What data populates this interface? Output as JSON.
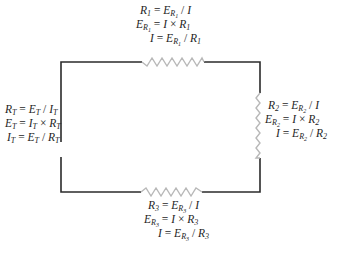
{
  "diagram": {
    "colors": {
      "wire": "#2b2b2b",
      "resistor": "#b8b8b8",
      "text": "#1e1e1e"
    },
    "total": {
      "label": "Total",
      "equations": [
        {
          "lhs": "R",
          "lhs_sub": "T",
          "op": "=",
          "a": "E",
          "a_sub": "T",
          "a_subsub": "",
          "op2": "/",
          "b": "I",
          "b_sub": "T"
        },
        {
          "lhs": "E",
          "lhs_sub": "T",
          "op": "=",
          "a": "I",
          "a_sub": "T",
          "a_subsub": "",
          "op2": "×",
          "b": "R",
          "b_sub": "T"
        },
        {
          "lhs": "I",
          "lhs_sub": "T",
          "op": "=",
          "a": "E",
          "a_sub": "T",
          "a_subsub": "",
          "op2": "/",
          "b": "R",
          "b_sub": "T"
        }
      ]
    },
    "resistors": [
      {
        "name": "R1",
        "position": "top",
        "equations": [
          {
            "lhs": "R",
            "lhs_sub": "1",
            "lhs_subsub": "",
            "op": "=",
            "a": "E",
            "a_sub": "R",
            "a_subsub": "1",
            "op2": "/",
            "b": "I",
            "b_sub": ""
          },
          {
            "lhs": "E",
            "lhs_sub": "R",
            "lhs_subsub": "1",
            "op": "=",
            "a": "I",
            "a_sub": "",
            "a_subsub": "",
            "op2": "×",
            "b": "R",
            "b_sub": "1"
          },
          {
            "lhs": "I",
            "lhs_sub": "",
            "lhs_subsub": "",
            "op": "=",
            "a": "E",
            "a_sub": "R",
            "a_subsub": "1",
            "op2": "/",
            "b": "R",
            "b_sub": "1"
          }
        ]
      },
      {
        "name": "R2",
        "position": "right",
        "equations": [
          {
            "lhs": "R",
            "lhs_sub": "2",
            "lhs_subsub": "",
            "op": "=",
            "a": "E",
            "a_sub": "R",
            "a_subsub": "2",
            "op2": "/",
            "b": "I",
            "b_sub": ""
          },
          {
            "lhs": "E",
            "lhs_sub": "R",
            "lhs_subsub": "2",
            "op": "=",
            "a": "I",
            "a_sub": "",
            "a_subsub": "",
            "op2": "×",
            "b": "R",
            "b_sub": "2"
          },
          {
            "lhs": "I",
            "lhs_sub": "",
            "lhs_subsub": "",
            "op": "=",
            "a": "E",
            "a_sub": "R",
            "a_subsub": "2",
            "op2": "/",
            "b": "R",
            "b_sub": "2"
          }
        ]
      },
      {
        "name": "R3",
        "position": "bottom",
        "equations": [
          {
            "lhs": "R",
            "lhs_sub": "3",
            "lhs_subsub": "",
            "op": "=",
            "a": "E",
            "a_sub": "R",
            "a_subsub": "3",
            "op2": "/",
            "b": "I",
            "b_sub": ""
          },
          {
            "lhs": "E",
            "lhs_sub": "R",
            "lhs_subsub": "3",
            "op": "=",
            "a": "I",
            "a_sub": "",
            "a_subsub": "",
            "op2": "×",
            "b": "R",
            "b_sub": "3"
          },
          {
            "lhs": "I",
            "lhs_sub": "",
            "lhs_subsub": "",
            "op": "=",
            "a": "E",
            "a_sub": "R",
            "a_subsub": "3",
            "op2": "/",
            "b": "R",
            "b_sub": "3"
          }
        ]
      }
    ]
  }
}
